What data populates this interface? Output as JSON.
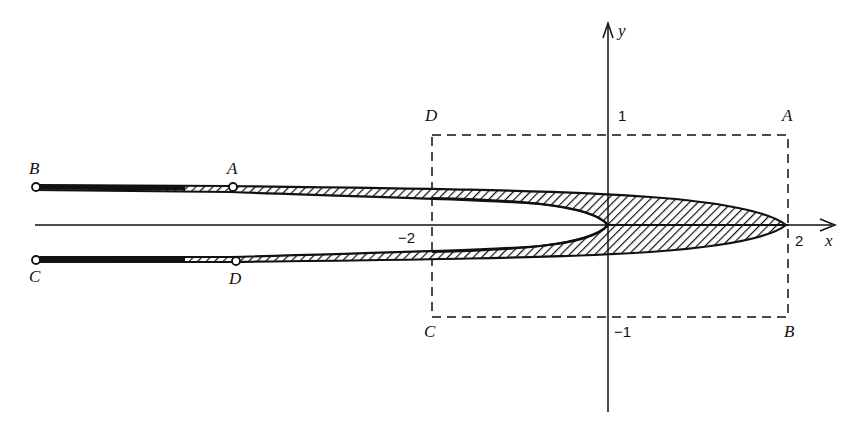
{
  "figure": {
    "type": "conformal-mapping-diagram",
    "axes": {
      "x_label": "x",
      "y_label": "y",
      "ticks": {
        "x_neg": "−2",
        "x_pos": "2",
        "y_pos": "1",
        "y_neg": "−1"
      }
    },
    "rectangle": {
      "style": "dashed",
      "corners": {
        "top_left": "D",
        "top_right": "A",
        "bottom_left": "C",
        "bottom_right": "B"
      }
    },
    "image_region": {
      "style": "hatched strip (hairpin shape) opening to the left",
      "points": {
        "upper_far": "B",
        "upper_near": "A",
        "lower_far": "C",
        "lower_near": "D"
      }
    },
    "colors": {
      "ink": "#111111",
      "background": "#ffffff"
    }
  }
}
